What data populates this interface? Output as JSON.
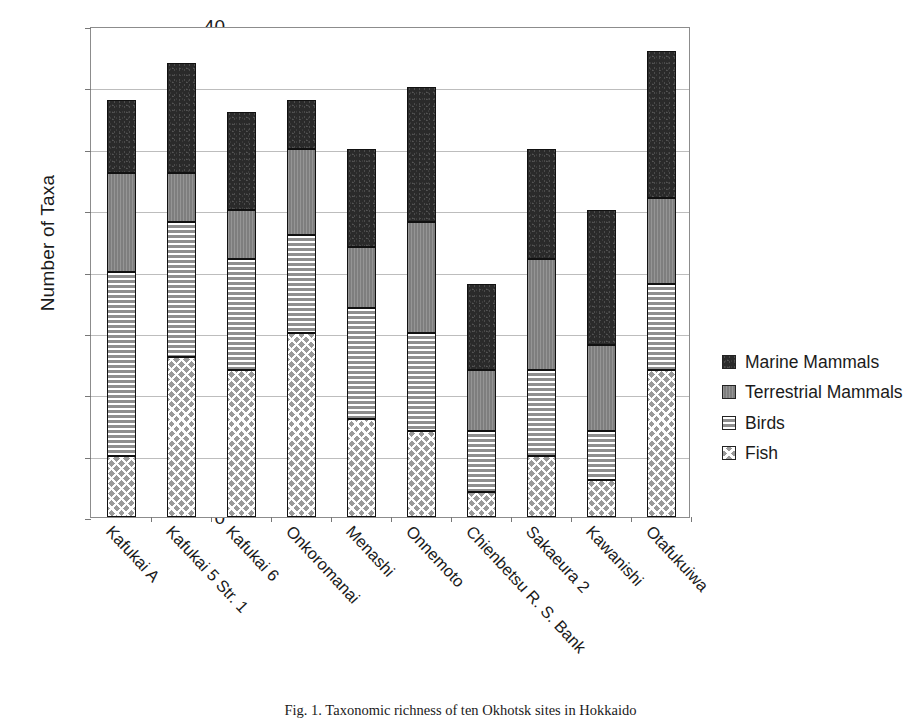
{
  "chart_data": {
    "type": "bar",
    "subtype": "stacked-bar",
    "title": "",
    "xlabel": "",
    "ylabel": "Number of Taxa",
    "ylim": [
      0,
      40
    ],
    "ytick_step": 5,
    "yticks": [
      40,
      35,
      30,
      25,
      20,
      15,
      10,
      5,
      0
    ],
    "grid": true,
    "legend_position": "right",
    "categories": [
      "Kafukai A",
      "Kafukai 5 Str. 1",
      "Kafukai 6",
      "Onkoromanai",
      "Menashi",
      "Onnemoto",
      "Chienbetsu R. S. Bank",
      "Sakaeura 2",
      "Kawanishi",
      "Otafukuiwa"
    ],
    "series": [
      {
        "name": "Fish",
        "color": "#9a9a9a",
        "pattern": "cross-hatch",
        "values": [
          5,
          13,
          12,
          15,
          8,
          7,
          2,
          5,
          3,
          12
        ]
      },
      {
        "name": "Birds",
        "color": "#9a9a9a",
        "pattern": "horizontal-stripes",
        "values": [
          15,
          11,
          9,
          8,
          9,
          8,
          5,
          7,
          4,
          7
        ]
      },
      {
        "name": "Terrestrial Mammals",
        "color": "#7e7e7e",
        "pattern": "solid-gray",
        "values": [
          8,
          4,
          4,
          7,
          5,
          9,
          5,
          9,
          7,
          7
        ]
      },
      {
        "name": "Marine Mammals",
        "color": "#2a2a2a",
        "pattern": "solid-dark",
        "values": [
          6,
          9,
          8,
          4,
          8,
          11,
          7,
          9,
          11,
          12
        ]
      }
    ],
    "totals": [
      34,
      37,
      33,
      34,
      30,
      35,
      19,
      30,
      25,
      38
    ]
  },
  "legend": {
    "items": [
      {
        "label": "Marine Mammals"
      },
      {
        "label": "Terrestrial Mammals"
      },
      {
        "label": "Birds"
      },
      {
        "label": "Fish"
      }
    ]
  },
  "caption": {
    "text": "Fig. 1.   Taxonomic richness of ten Okhotsk sites in Hokkaido"
  }
}
